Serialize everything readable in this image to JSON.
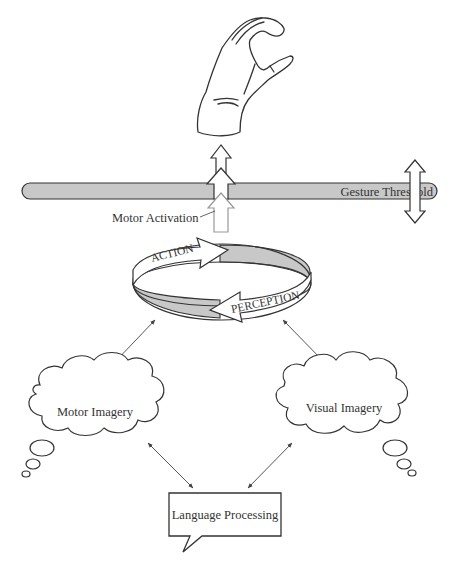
{
  "diagram": {
    "gesture_threshold": {
      "label": "Gesture Threshold"
    },
    "motor_activation": {
      "label": "Motor Activation"
    },
    "cycle": {
      "action_label": "ACTION",
      "perception_label": "PERCEPTION"
    },
    "motor_imagery": {
      "label": "Motor Imagery"
    },
    "visual_imagery": {
      "label": "Visual Imagery"
    },
    "language_processing": {
      "label": "Language Processing"
    },
    "hand": {
      "icon": "hand-gesture-icon"
    },
    "colors": {
      "bar_fill": "#c8c8c8",
      "ring_shade": "#c8c8c8",
      "stroke": "#333333",
      "background": "#ffffff"
    }
  }
}
